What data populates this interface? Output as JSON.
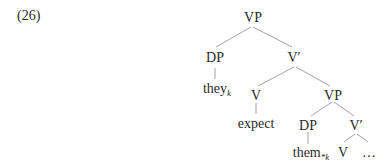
{
  "example_number": "(26)",
  "tree": {
    "root": "VP",
    "nodes": {
      "vp_top": "VP",
      "dp_subject": "DP",
      "vbar_top": "V′",
      "they": "they",
      "they_index": "k",
      "v_head": "V",
      "expect": "expect",
      "vp_lower": "VP",
      "dp_object": "DP",
      "them": "them",
      "them_index": "*k",
      "vbar_lower": "V′",
      "v_lower": "V",
      "ellipsis": "…"
    },
    "line_color": "#8a8a8a"
  }
}
